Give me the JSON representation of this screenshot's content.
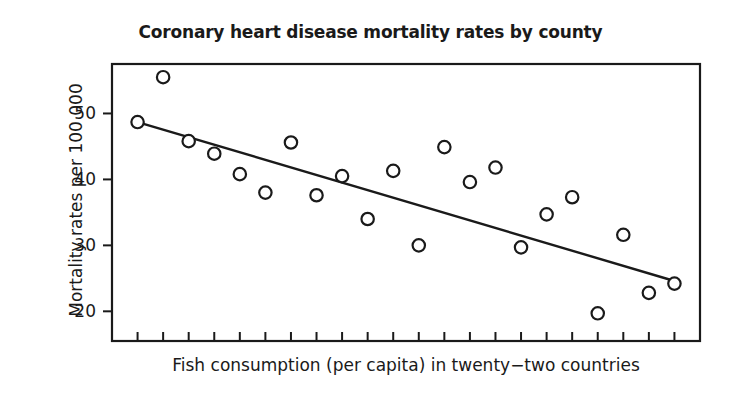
{
  "chart_data": {
    "type": "scatter",
    "title": "Coronary heart disease mortality rates by county",
    "xlabel": "Fish consumption (per capita) in twenty−two countries",
    "ylabel": "Mortality rates per 100 000",
    "grid": false,
    "legend": null,
    "xlim": [
      0,
      23
    ],
    "ylim": [
      15.5,
      57.5
    ],
    "yticks": [
      20,
      30,
      40,
      50
    ],
    "ytick_labels": [
      "20",
      "30",
      "40",
      "50"
    ],
    "xticks_labeled": false,
    "x_tick_count": 22,
    "marker": "open-circle",
    "point_color": "#1a1a1a",
    "line_color": "#1a1a1a",
    "x": [
      2.0,
      1.0,
      3.0,
      4.0,
      5.0,
      6.0,
      7.0,
      8.0,
      9.0,
      10.0,
      11.0,
      12.0,
      13.0,
      14.0,
      15.0,
      16.0,
      17.0,
      18.0,
      19.0,
      20.0,
      21.0,
      22.0
    ],
    "y": [
      55.5,
      48.7,
      45.8,
      43.9,
      40.8,
      38.0,
      45.6,
      37.6,
      40.5,
      34.0,
      41.3,
      30.0,
      44.9,
      39.6,
      41.8,
      29.7,
      34.7,
      37.3,
      19.7,
      31.6,
      22.8,
      24.2
    ],
    "points": [
      {
        "x": 2.0,
        "y": 55.5
      },
      {
        "x": 1.0,
        "y": 48.7
      },
      {
        "x": 3.0,
        "y": 45.8
      },
      {
        "x": 4.0,
        "y": 43.9
      },
      {
        "x": 5.0,
        "y": 40.8
      },
      {
        "x": 6.0,
        "y": 38.0
      },
      {
        "x": 7.0,
        "y": 45.6
      },
      {
        "x": 8.0,
        "y": 37.6
      },
      {
        "x": 9.0,
        "y": 40.5
      },
      {
        "x": 10.0,
        "y": 34.0
      },
      {
        "x": 11.0,
        "y": 41.3
      },
      {
        "x": 12.0,
        "y": 30.0
      },
      {
        "x": 13.0,
        "y": 44.9
      },
      {
        "x": 14.0,
        "y": 39.6
      },
      {
        "x": 15.0,
        "y": 41.8
      },
      {
        "x": 16.0,
        "y": 29.7
      },
      {
        "x": 17.0,
        "y": 34.7
      },
      {
        "x": 18.0,
        "y": 37.3
      },
      {
        "x": 19.0,
        "y": 19.7
      },
      {
        "x": 20.0,
        "y": 31.6
      },
      {
        "x": 21.0,
        "y": 22.8
      },
      {
        "x": 22.0,
        "y": 24.2
      }
    ],
    "trendline": {
      "name": "regression-line",
      "x0": 1.0,
      "y0": 48.7,
      "x1": 22.0,
      "y1": 24.6
    }
  }
}
